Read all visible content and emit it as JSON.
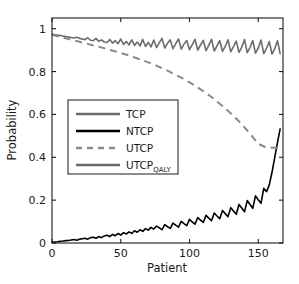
{
  "chart_data": {
    "type": "line",
    "title": "",
    "xlabel": "Patient",
    "ylabel": "Probability",
    "xlim": [
      0,
      168
    ],
    "ylim": [
      0,
      1.05
    ],
    "xticks": [
      0,
      50,
      100,
      150
    ],
    "xticklabels": [
      "0",
      "50",
      "100",
      "150"
    ],
    "yticks": [
      0,
      0.2,
      0.4,
      0.6,
      0.8,
      1
    ],
    "yticklabels": [
      "0",
      "0.2",
      "0.4",
      "0.6",
      "0.8",
      "1"
    ],
    "grid": false,
    "legend_position": "center-left",
    "series": [
      {
        "name": "TCP",
        "label": "TCP",
        "color": "#6b6b6b",
        "style": "solid",
        "width": 1.6,
        "x": [
          0,
          2,
          4,
          6,
          8,
          10,
          12,
          14,
          16,
          18,
          20,
          22,
          24,
          26,
          28,
          30,
          32,
          34,
          36,
          38,
          40,
          42,
          44,
          46,
          48,
          50,
          52,
          54,
          56,
          58,
          60,
          62,
          64,
          66,
          68,
          70,
          72,
          74,
          76,
          78,
          80,
          82,
          84,
          86,
          88,
          90,
          92,
          94,
          96,
          98,
          100,
          102,
          104,
          106,
          108,
          110,
          112,
          114,
          116,
          118,
          120,
          122,
          124,
          126,
          128,
          130,
          132,
          134,
          136,
          138,
          140,
          142,
          144,
          146,
          148,
          150,
          152,
          154,
          156,
          158,
          160,
          162,
          164,
          166
        ],
        "values": [
          0.975,
          0.972,
          0.97,
          0.968,
          0.966,
          0.963,
          0.961,
          0.959,
          0.957,
          0.96,
          0.955,
          0.952,
          0.949,
          0.958,
          0.946,
          0.944,
          0.955,
          0.941,
          0.948,
          0.938,
          0.936,
          0.95,
          0.933,
          0.944,
          0.93,
          0.952,
          0.927,
          0.94,
          0.925,
          0.948,
          0.922,
          0.938,
          0.92,
          0.95,
          0.917,
          0.936,
          0.915,
          0.947,
          0.912,
          0.934,
          0.955,
          0.91,
          0.932,
          0.948,
          0.907,
          0.93,
          0.952,
          0.905,
          0.928,
          0.945,
          0.902,
          0.926,
          0.95,
          0.9,
          0.924,
          0.946,
          0.898,
          0.922,
          0.951,
          0.896,
          0.92,
          0.944,
          0.894,
          0.918,
          0.948,
          0.892,
          0.916,
          0.942,
          0.89,
          0.914,
          0.95,
          0.888,
          0.912,
          0.945,
          0.886,
          0.91,
          0.947,
          0.884,
          0.908,
          0.94,
          0.882,
          0.906,
          0.944,
          0.88
        ]
      },
      {
        "name": "NTCP",
        "label": "NTCP",
        "color": "#000000",
        "style": "solid",
        "width": 1.6,
        "x": [
          0,
          2,
          4,
          6,
          8,
          10,
          12,
          14,
          16,
          18,
          20,
          22,
          24,
          26,
          28,
          30,
          32,
          34,
          36,
          38,
          40,
          42,
          44,
          46,
          48,
          50,
          52,
          54,
          56,
          58,
          60,
          62,
          64,
          66,
          68,
          70,
          72,
          74,
          76,
          78,
          80,
          82,
          84,
          86,
          88,
          90,
          92,
          94,
          96,
          98,
          100,
          102,
          104,
          106,
          108,
          110,
          112,
          114,
          116,
          118,
          120,
          122,
          124,
          126,
          128,
          130,
          132,
          134,
          136,
          138,
          140,
          142,
          144,
          146,
          148,
          150,
          152,
          154,
          156,
          158,
          160,
          162,
          164,
          166
        ],
        "values": [
          0.003,
          0.005,
          0.006,
          0.008,
          0.009,
          0.011,
          0.012,
          0.014,
          0.016,
          0.013,
          0.018,
          0.02,
          0.022,
          0.018,
          0.025,
          0.027,
          0.022,
          0.03,
          0.025,
          0.033,
          0.036,
          0.03,
          0.04,
          0.034,
          0.044,
          0.037,
          0.048,
          0.042,
          0.052,
          0.045,
          0.057,
          0.05,
          0.062,
          0.054,
          0.067,
          0.06,
          0.073,
          0.065,
          0.079,
          0.071,
          0.062,
          0.086,
          0.076,
          0.068,
          0.093,
          0.083,
          0.074,
          0.101,
          0.09,
          0.081,
          0.11,
          0.098,
          0.088,
          0.119,
          0.107,
          0.096,
          0.129,
          0.116,
          0.104,
          0.14,
          0.126,
          0.113,
          0.152,
          0.137,
          0.123,
          0.165,
          0.149,
          0.134,
          0.18,
          0.163,
          0.146,
          0.198,
          0.18,
          0.162,
          0.22,
          0.202,
          0.185,
          0.255,
          0.24,
          0.27,
          0.33,
          0.4,
          0.47,
          0.535
        ]
      },
      {
        "name": "UTCP",
        "label": "UTCP",
        "color": "#8a8a8a",
        "style": "dashed",
        "width": 2.0,
        "x": [
          0,
          5,
          10,
          15,
          20,
          25,
          30,
          35,
          40,
          45,
          50,
          55,
          60,
          65,
          70,
          75,
          80,
          85,
          90,
          95,
          100,
          105,
          110,
          115,
          120,
          125,
          130,
          135,
          140,
          145,
          150,
          155,
          160,
          165
        ],
        "values": [
          0.972,
          0.963,
          0.955,
          0.947,
          0.939,
          0.931,
          0.922,
          0.914,
          0.905,
          0.896,
          0.887,
          0.877,
          0.866,
          0.855,
          0.843,
          0.83,
          0.816,
          0.801,
          0.785,
          0.768,
          0.75,
          0.73,
          0.709,
          0.686,
          0.661,
          0.634,
          0.605,
          0.574,
          0.54,
          0.503,
          0.463,
          0.448,
          0.445,
          0.444
        ]
      },
      {
        "name": "UTCP_QALY",
        "label": "UTCP",
        "label_subscript": "QALY",
        "color": "#6b6b6b",
        "style": "solid",
        "width": 2.0,
        "x": [],
        "values": []
      }
    ],
    "legend": [
      {
        "label": "TCP",
        "subscript": "",
        "color": "#6b6b6b",
        "style": "solid"
      },
      {
        "label": "NTCP",
        "subscript": "",
        "color": "#000000",
        "style": "solid"
      },
      {
        "label": "UTCP",
        "subscript": "",
        "color": "#8a8a8a",
        "style": "dashed"
      },
      {
        "label": "UTCP",
        "subscript": "QALY",
        "color": "#6b6b6b",
        "style": "solid"
      }
    ]
  }
}
